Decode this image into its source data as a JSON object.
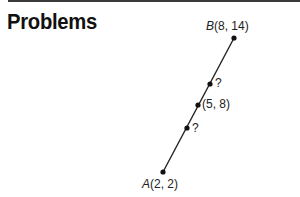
{
  "header": {
    "title": "Problems"
  },
  "figure": {
    "segment": {
      "from": "A",
      "to": "B",
      "color": "#222222"
    },
    "points": [
      {
        "name": "B",
        "letter": "B",
        "coords": "(8, 14)",
        "x": 234,
        "y": 38
      },
      {
        "name": "upper-unknown",
        "letter": "",
        "coords": "?",
        "x": 210,
        "y": 84
      },
      {
        "name": "midpoint",
        "letter": "",
        "coords": "(5, 8)",
        "x": 198,
        "y": 105
      },
      {
        "name": "lower-unknown",
        "letter": "",
        "coords": "?",
        "x": 187,
        "y": 128
      },
      {
        "name": "A",
        "letter": "A",
        "coords": "(2, 2)",
        "x": 163,
        "y": 172
      }
    ]
  }
}
